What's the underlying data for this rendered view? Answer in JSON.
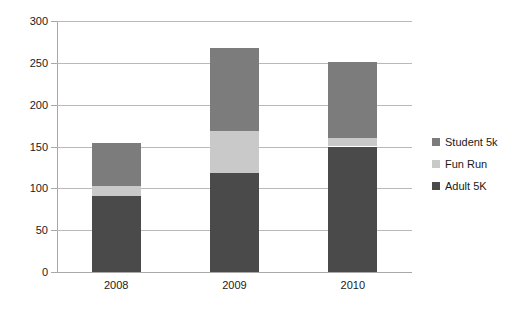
{
  "chart_data": {
    "type": "bar",
    "subtype": "stacked-column",
    "title": "",
    "xlabel": "",
    "ylabel": "",
    "categories": [
      "2008",
      "2009",
      "2010"
    ],
    "series": [
      {
        "name": "Adult 5K",
        "color": "#4a4a4a",
        "values": [
          91,
          118,
          150
        ]
      },
      {
        "name": "Fun Run",
        "color": "#c9c9c9",
        "values": [
          12,
          51,
          10
        ]
      },
      {
        "name": "Student 5k",
        "color": "#7c7c7c",
        "values": [
          51,
          99,
          91
        ]
      }
    ],
    "stack_totals": [
      154,
      268,
      251
    ],
    "ylim": [
      0,
      300
    ],
    "ytick_values": [
      0,
      50,
      100,
      150,
      200,
      250,
      300
    ],
    "ytick_labels": [
      "0",
      "50",
      "100",
      "150",
      "200",
      "250",
      "300"
    ],
    "grid": true,
    "grid_axis": "y",
    "legend_position": "right",
    "legend_entries": [
      "Student 5k",
      "Fun Run",
      "Adult 5K"
    ],
    "legend_colors": [
      "#7c7c7c",
      "#c9c9c9",
      "#4a4a4a"
    ],
    "background": "#ffffff",
    "gridline_color": "#b9b9b9",
    "axis_color": "#a8a8a8"
  }
}
